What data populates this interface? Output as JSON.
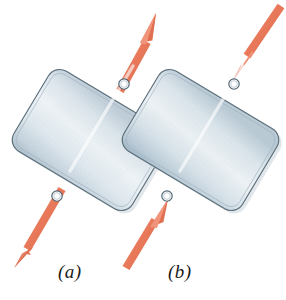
{
  "figure": {
    "background_color": "#ffffff",
    "width": 286,
    "height": 300,
    "caption_font_style": "italic-serif"
  },
  "colors": {
    "force_arrow": "#E8795A",
    "force_arrow_light": "#F0A088",
    "force_arrow_dark": "#D7644A",
    "link_outline": "#5A6E7A",
    "link_fill_light": "#EEF3F6",
    "link_fill_mid": "#D8E2E8",
    "link_fill_dark": "#AEC0CC",
    "hole_fill": "#FFFFFF",
    "hole_outline": "#4E6270",
    "label_text": "#1B1B1B",
    "shadow": "#C9D4DB"
  },
  "panels": [
    {
      "id": "a",
      "label": "(a)",
      "loading_type": "tension",
      "description": "Two-force member loaded in tension: equal and opposite forces act outward along the line joining the two pin holes.",
      "link": {
        "hole_lower": {
          "x": 57,
          "y": 196
        },
        "hole_upper": {
          "x": 124,
          "y": 84
        },
        "hole_radius": 5.2,
        "bar_half_width": 13,
        "angle_deg": 59.1
      },
      "arrows": [
        {
          "name": "upper-force-arrow",
          "direction": "outward-up-right",
          "tail": {
            "x": 124,
            "y": 84
          },
          "tip": {
            "x": 152,
            "y": 11
          }
        },
        {
          "name": "lower-force-arrow",
          "direction": "outward-down-left",
          "tail": {
            "x": 57,
            "y": 196
          },
          "tip": {
            "x": 18,
            "y": 262
          }
        }
      ]
    },
    {
      "id": "b",
      "label": "(b)",
      "loading_type": "compression",
      "description": "Two-force member loaded in compression: equal and opposite forces act inward along the line joining the two pin holes.",
      "link": {
        "hole_lower": {
          "x": 167,
          "y": 196
        },
        "hole_upper": {
          "x": 234,
          "y": 84
        },
        "hole_radius": 5.2,
        "bar_half_width": 13,
        "angle_deg": 59.1
      },
      "arrows": [
        {
          "name": "upper-force-arrow",
          "direction": "inward-down-left",
          "tail": {
            "x": 279,
            "y": 8
          },
          "tip": {
            "x": 236,
            "y": 79
          }
        },
        {
          "name": "lower-force-arrow",
          "direction": "inward-up-right",
          "tail": {
            "x": 128,
            "y": 264
          },
          "tip": {
            "x": 165,
            "y": 201
          }
        }
      ]
    }
  ]
}
